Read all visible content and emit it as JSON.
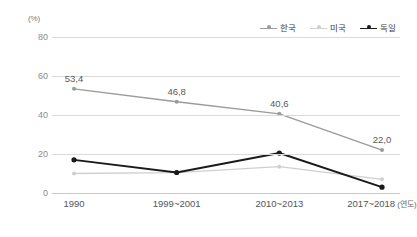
{
  "chart_data": {
    "type": "line",
    "title": "",
    "subtitle": "",
    "xlabel": "연도",
    "ylabel": "(%)",
    "ylim": [
      0,
      80
    ],
    "ytick_values": [
      0,
      20,
      40,
      60,
      80
    ],
    "ytick_labels": [
      "0",
      "20",
      "40",
      "60",
      "80"
    ],
    "grid": true,
    "legend_position": "top-right",
    "categories": [
      "1990",
      "1999~2001",
      "2010~2013",
      "2017~2018"
    ],
    "x_axis_unit_note": "(연도)",
    "series": [
      {
        "name": "한국",
        "color": "#9b9b9b",
        "values": [
          53.4,
          46.8,
          40.6,
          22.0
        ],
        "labels": [
          "53,4",
          "46,8",
          "40,6",
          "22,0"
        ],
        "show_labels": true
      },
      {
        "name": "미국",
        "color": "#cfcfcf",
        "values": [
          10.0,
          10.5,
          13.5,
          7.0
        ],
        "labels": [
          "",
          "",
          "",
          ""
        ],
        "show_labels": false
      },
      {
        "name": "독일",
        "color": "#1a1a1a",
        "values": [
          17.0,
          10.5,
          20.5,
          3.0
        ],
        "labels": [
          "",
          "",
          "",
          ""
        ],
        "show_labels": false
      }
    ]
  },
  "axis": {
    "unit_label": "(%)",
    "y_ticks": [
      "80",
      "60",
      "40",
      "20",
      "0"
    ],
    "x_ticks": [
      "1990",
      "1999~2001",
      "2010~2013",
      "2017~2018"
    ],
    "x_unit": "(연도)"
  },
  "legend": {
    "items": [
      {
        "label": "한국",
        "color": "#9b9b9b"
      },
      {
        "label": "미국",
        "color": "#cfcfcf"
      },
      {
        "label": "독일",
        "color": "#1a1a1a"
      }
    ]
  },
  "data_labels": {
    "korea": [
      "53,4",
      "46,8",
      "40,6",
      "22,0"
    ]
  }
}
